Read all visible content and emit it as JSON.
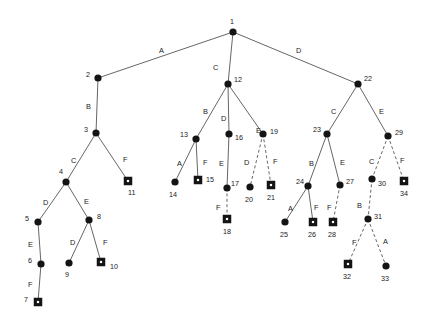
{
  "diagram": {
    "node_shapes": {
      "circle": "internal-node",
      "square": "leaf-node"
    },
    "edge_styles": {
      "solid": "solid-edge",
      "dashed": "dashed-edge"
    },
    "colors": {
      "node": "#141414",
      "edge": "#555555",
      "background": "#ffffff",
      "text": "#1a1a1a"
    },
    "nodes": [
      {
        "id": "1",
        "label": "1",
        "shape": "circle",
        "x": 233,
        "y": 32,
        "lx": 230,
        "ly": 18
      },
      {
        "id": "2",
        "label": "2",
        "shape": "circle",
        "x": 98,
        "y": 78,
        "lx": 86,
        "ly": 71
      },
      {
        "id": "3",
        "label": "3",
        "shape": "circle",
        "x": 96,
        "y": 133,
        "lx": 84,
        "ly": 126
      },
      {
        "id": "4",
        "label": "4",
        "shape": "circle",
        "x": 66,
        "y": 182,
        "lx": 59,
        "ly": 168
      },
      {
        "id": "5",
        "label": "5",
        "shape": "circle",
        "x": 38,
        "y": 222,
        "lx": 25,
        "ly": 215
      },
      {
        "id": "6",
        "label": "6",
        "shape": "circle",
        "x": 41,
        "y": 264,
        "lx": 28,
        "ly": 257
      },
      {
        "id": "7",
        "label": "7",
        "shape": "square",
        "x": 38,
        "y": 302,
        "lx": 24,
        "ly": 296
      },
      {
        "id": "8",
        "label": "8",
        "shape": "circle",
        "x": 89,
        "y": 220,
        "lx": 97,
        "ly": 213
      },
      {
        "id": "9",
        "label": "9",
        "shape": "circle",
        "x": 69,
        "y": 263,
        "lx": 65,
        "ly": 271
      },
      {
        "id": "10",
        "label": "10",
        "shape": "square",
        "x": 101,
        "y": 262,
        "lx": 110,
        "ly": 263
      },
      {
        "id": "11",
        "label": "11",
        "shape": "square",
        "x": 128,
        "y": 181,
        "lx": 128,
        "ly": 189
      },
      {
        "id": "12",
        "label": "12",
        "shape": "circle",
        "x": 228,
        "y": 84,
        "lx": 234,
        "ly": 76
      },
      {
        "id": "13",
        "label": "13",
        "shape": "circle",
        "x": 196,
        "y": 139,
        "lx": 180,
        "ly": 131
      },
      {
        "id": "14",
        "label": "14",
        "shape": "circle",
        "x": 175,
        "y": 182,
        "lx": 169,
        "ly": 191
      },
      {
        "id": "15",
        "label": "15",
        "shape": "square",
        "x": 198,
        "y": 180,
        "lx": 206,
        "ly": 176
      },
      {
        "id": "16",
        "label": "16",
        "shape": "circle",
        "x": 229,
        "y": 134,
        "lx": 235,
        "ly": 134
      },
      {
        "id": "17",
        "label": "17",
        "shape": "circle",
        "x": 227,
        "y": 188,
        "lx": 231,
        "ly": 180
      },
      {
        "id": "18",
        "label": "18",
        "shape": "square",
        "x": 227,
        "y": 219,
        "lx": 223,
        "ly": 228
      },
      {
        "id": "19",
        "label": "19",
        "shape": "circle",
        "x": 263,
        "y": 134,
        "lx": 270,
        "ly": 128
      },
      {
        "id": "20",
        "label": "20",
        "shape": "circle",
        "x": 250,
        "y": 187,
        "lx": 245,
        "ly": 196
      },
      {
        "id": "21",
        "label": "21",
        "shape": "square",
        "x": 271,
        "y": 185,
        "lx": 267,
        "ly": 194
      },
      {
        "id": "22",
        "label": "22",
        "shape": "circle",
        "x": 358,
        "y": 84,
        "lx": 364,
        "ly": 75
      },
      {
        "id": "23",
        "label": "23",
        "shape": "circle",
        "x": 327,
        "y": 134,
        "lx": 313,
        "ly": 126
      },
      {
        "id": "24",
        "label": "24",
        "shape": "circle",
        "x": 308,
        "y": 186,
        "lx": 296,
        "ly": 178
      },
      {
        "id": "25",
        "label": "25",
        "shape": "circle",
        "x": 285,
        "y": 222,
        "lx": 280,
        "ly": 231
      },
      {
        "id": "26",
        "label": "26",
        "shape": "square",
        "x": 313,
        "y": 222,
        "lx": 308,
        "ly": 231
      },
      {
        "id": "27",
        "label": "27",
        "shape": "circle",
        "x": 340,
        "y": 185,
        "lx": 346,
        "ly": 178
      },
      {
        "id": "28",
        "label": "28",
        "shape": "square",
        "x": 333,
        "y": 222,
        "lx": 328,
        "ly": 231
      },
      {
        "id": "29",
        "label": "29",
        "shape": "circle",
        "x": 388,
        "y": 136,
        "lx": 395,
        "ly": 129
      },
      {
        "id": "30",
        "label": "30",
        "shape": "circle",
        "x": 372,
        "y": 179,
        "lx": 378,
        "ly": 180
      },
      {
        "id": "31",
        "label": "31",
        "shape": "circle",
        "x": 368,
        "y": 219,
        "lx": 374,
        "ly": 213
      },
      {
        "id": "32",
        "label": "32",
        "shape": "square",
        "x": 348,
        "y": 264,
        "lx": 343,
        "ly": 273
      },
      {
        "id": "33",
        "label": "33",
        "shape": "circle",
        "x": 386,
        "y": 266,
        "lx": 381,
        "ly": 275
      },
      {
        "id": "34",
        "label": "34",
        "shape": "square",
        "x": 404,
        "y": 181,
        "lx": 400,
        "ly": 190
      }
    ],
    "edges": [
      {
        "from": "1",
        "to": "2",
        "label": "A",
        "style": "solid",
        "lx": 159,
        "ly": 47
      },
      {
        "from": "1",
        "to": "12",
        "label": "C",
        "style": "solid",
        "lx": 213,
        "ly": 64
      },
      {
        "from": "1",
        "to": "22",
        "label": "D",
        "style": "solid",
        "lx": 296,
        "ly": 47
      },
      {
        "from": "2",
        "to": "3",
        "label": "B",
        "style": "solid",
        "lx": 86,
        "ly": 103
      },
      {
        "from": "3",
        "to": "4",
        "label": "C",
        "style": "solid",
        "lx": 71,
        "ly": 157
      },
      {
        "from": "3",
        "to": "11",
        "label": "F",
        "style": "solid",
        "lx": 123,
        "ly": 156
      },
      {
        "from": "4",
        "to": "5",
        "label": "D",
        "style": "solid",
        "lx": 43,
        "ly": 199
      },
      {
        "from": "4",
        "to": "8",
        "label": "E",
        "style": "solid",
        "lx": 84,
        "ly": 198
      },
      {
        "from": "5",
        "to": "6",
        "label": "E",
        "style": "solid",
        "lx": 28,
        "ly": 241
      },
      {
        "from": "6",
        "to": "7",
        "label": "F",
        "style": "solid",
        "lx": 28,
        "ly": 281
      },
      {
        "from": "8",
        "to": "9",
        "label": "D",
        "style": "solid",
        "lx": 70,
        "ly": 239
      },
      {
        "from": "8",
        "to": "10",
        "label": "F",
        "style": "solid",
        "lx": 103,
        "ly": 239
      },
      {
        "from": "12",
        "to": "13",
        "label": "B",
        "style": "solid",
        "lx": 203,
        "ly": 108
      },
      {
        "from": "12",
        "to": "16",
        "label": "D",
        "style": "solid",
        "lx": 221,
        "ly": 115
      },
      {
        "from": "12",
        "to": "19",
        "label": "E",
        "style": "solid",
        "lx": 256,
        "ly": 127
      },
      {
        "from": "13",
        "to": "14",
        "label": "A",
        "style": "solid",
        "lx": 177,
        "ly": 160
      },
      {
        "from": "13",
        "to": "15",
        "label": "F",
        "style": "solid",
        "lx": 203,
        "ly": 159
      },
      {
        "from": "16",
        "to": "17",
        "label": "E",
        "style": "solid-v",
        "lx": 219,
        "ly": 160
      },
      {
        "from": "17",
        "to": "18",
        "label": "F",
        "style": "dashed",
        "lx": 216,
        "ly": 204
      },
      {
        "from": "19",
        "to": "20",
        "label": "D",
        "style": "dashed",
        "lx": 244,
        "ly": 159
      },
      {
        "from": "19",
        "to": "21",
        "label": "F",
        "style": "dashed",
        "lx": 273,
        "ly": 158
      },
      {
        "from": "22",
        "to": "23",
        "label": "C",
        "style": "solid",
        "lx": 331,
        "ly": 108
      },
      {
        "from": "22",
        "to": "29",
        "label": "E",
        "style": "solid",
        "lx": 379,
        "ly": 108
      },
      {
        "from": "23",
        "to": "24",
        "label": "B",
        "style": "solid",
        "lx": 309,
        "ly": 160
      },
      {
        "from": "23",
        "to": "27",
        "label": "E",
        "style": "solid",
        "lx": 340,
        "ly": 159
      },
      {
        "from": "24",
        "to": "25",
        "label": "A",
        "style": "solid",
        "lx": 288,
        "ly": 205
      },
      {
        "from": "24",
        "to": "26",
        "label": "F",
        "style": "solid",
        "lx": 314,
        "ly": 204
      },
      {
        "from": "27",
        "to": "28",
        "label": "F",
        "style": "dashed",
        "lx": 327,
        "ly": 204
      },
      {
        "from": "29",
        "to": "30",
        "label": "C",
        "style": "dashed",
        "lx": 369,
        "ly": 158
      },
      {
        "from": "29",
        "to": "34",
        "label": "F",
        "style": "dashed",
        "lx": 400,
        "ly": 157
      },
      {
        "from": "30",
        "to": "31",
        "label": "B",
        "style": "dashed",
        "lx": 357,
        "ly": 202
      },
      {
        "from": "31",
        "to": "32",
        "label": "F",
        "style": "dashed",
        "lx": 352,
        "ly": 239
      },
      {
        "from": "31",
        "to": "33",
        "label": "A",
        "style": "dashed",
        "lx": 383,
        "ly": 238
      }
    ]
  }
}
